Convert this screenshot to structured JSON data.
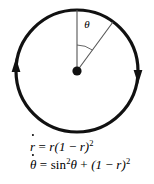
{
  "figure": {
    "type": "phase-portrait",
    "circle": {
      "center_x": 77,
      "center_y": 71,
      "radius": 61,
      "stroke_color": "#111111",
      "stroke_width": 3.2
    },
    "center_point": {
      "label": "origin-dot",
      "x": 77,
      "y": 71,
      "radius": 4.6,
      "color": "#111111"
    },
    "reference_radius": {
      "label": "vertical-radius",
      "from_x": 77,
      "from_y": 71,
      "to_x": 77,
      "to_y": 10,
      "stroke_color": "#555555",
      "stroke_width": 1.1
    },
    "angle_radius": {
      "label": "slanted-radius",
      "from_x": 77,
      "from_y": 71,
      "to_x": 113,
      "to_y": 22,
      "stroke_color": "#555555",
      "stroke_width": 1.1,
      "angle_from_vertical_deg": 30
    },
    "angle_arc": {
      "label": "theta-arc",
      "radius": 26,
      "start_deg": -90,
      "end_deg": -54,
      "stroke_color": "#555555",
      "stroke_width": 0.9
    },
    "angle_label": {
      "symbol": "θ",
      "x": 87,
      "y": 24,
      "font_size": 11
    },
    "arrows": [
      {
        "label": "arrow-right-down",
        "x": 138,
        "y": 71,
        "direction": "down",
        "color": "#111111"
      },
      {
        "label": "arrow-left-up",
        "x": 16,
        "y": 71,
        "direction": "up",
        "color": "#111111"
      }
    ],
    "flow_direction": "clockwise"
  },
  "equations": {
    "radial": {
      "variable": "r",
      "dot": "·",
      "equals": "=",
      "rhs_lead": "r(1",
      "minus": "−",
      "rhs_var": "r)",
      "exponent": "2",
      "plain_text": "ṙ = r(1 − r)²"
    },
    "angular": {
      "variable": "θ",
      "dot": "·",
      "equals": "=",
      "fn": "sin",
      "fn_exponent": "2",
      "fn_arg": "θ",
      "plus": "+",
      "term_lead": "(1",
      "minus": "−",
      "term_var": "r)",
      "exponent": "2",
      "plain_text": "θ̇ = sin²θ + (1 − r)²"
    }
  },
  "colors": {
    "background": "#ffffff",
    "ink": "#000000",
    "thin_line": "#555555",
    "thick_line": "#111111"
  }
}
